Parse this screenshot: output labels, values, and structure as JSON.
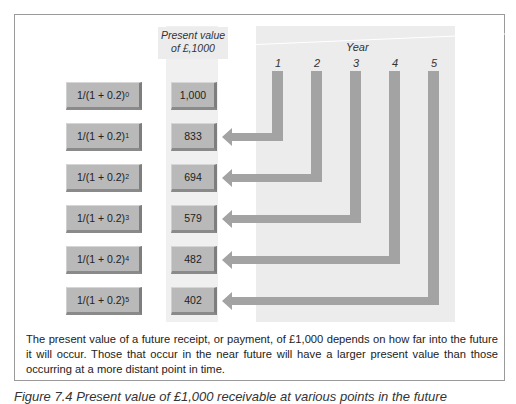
{
  "header": {
    "present_value_label_line1": "Present value",
    "present_value_label_line2": "of £,1000",
    "year_label": "Year",
    "years": [
      "1",
      "2",
      "3",
      "4",
      "5"
    ]
  },
  "rows": [
    {
      "formula_base": "1/(1 + 0.2)",
      "exponent": "0",
      "value": "1,000"
    },
    {
      "formula_base": "1/(1 + 0.2)",
      "exponent": "1",
      "value": "833"
    },
    {
      "formula_base": "1/(1 + 0.2)",
      "exponent": "2",
      "value": "694"
    },
    {
      "formula_base": "1/(1 + 0.2)",
      "exponent": "3",
      "value": "579"
    },
    {
      "formula_base": "1/(1 + 0.2)",
      "exponent": "4",
      "value": "482"
    },
    {
      "formula_base": "1/(1 + 0.2)",
      "exponent": "5",
      "value": "402"
    }
  ],
  "description": "The present value of a future receipt, or payment, of £1,000 depends on how far into the future it will occur. Those that occur in the near future will have a larger present value than those occurring at a more distant point in time.",
  "figure_caption": "Figure 7.4 Present value of £1,000 receivable at various points in the future",
  "colors": {
    "box_face": "#b9b9b9",
    "arrow": "#a3a3a3",
    "panel": "#ececec"
  }
}
